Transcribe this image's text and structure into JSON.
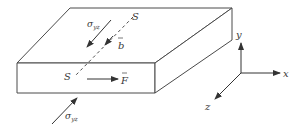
{
  "diagram": {
    "colors": {
      "line": "#4a4a4a",
      "text": "#3a3a3a",
      "background": "#ffffff"
    },
    "labels": {
      "slip_line_top": "S",
      "slip_line_bottom": "S",
      "stress_top": "σ",
      "stress_top_sub": "yz",
      "stress_bottom": "σ",
      "stress_bottom_sub": "yz",
      "burgers_vector": "b",
      "force": "F",
      "axis_x": "x",
      "axis_y": "y",
      "axis_z": "z"
    }
  }
}
